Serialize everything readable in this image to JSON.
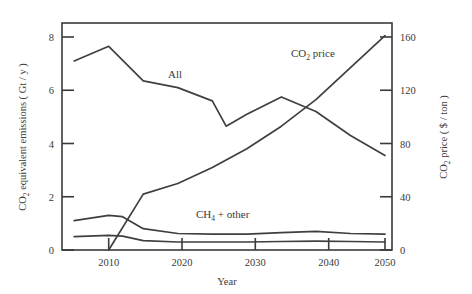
{
  "chart_data": {
    "type": "line",
    "title": "",
    "xlabel": "Year",
    "ylabel": "CO 2 equivalent emissions ( Gt / y )",
    "y2label": "CO 2 price ( $ / ton )",
    "xlim": [
      2005,
      2050
    ],
    "ylim": [
      0,
      8.6
    ],
    "y2lim": [
      0,
      172
    ],
    "grid": false,
    "legend_position": "inline-annotations",
    "xticks": [
      2010,
      2020,
      2030,
      2040,
      2050
    ],
    "xticklabels": [
      "2010",
      "2020",
      "2030",
      "2040",
      "2050"
    ],
    "yticks": [
      0,
      2,
      4,
      6,
      8
    ],
    "yticklabels": [
      "0",
      "2",
      "4",
      "6",
      "8"
    ],
    "y2ticks": [
      0,
      40,
      80,
      120,
      160
    ],
    "y2ticklabels": [
      "0",
      "40",
      "80",
      "120",
      "160"
    ],
    "annotations": [
      {
        "text": "All",
        "x": 2023,
        "y": 6.6
      },
      {
        "text": "CO 2 price",
        "x": 2043,
        "y": 7.5
      },
      {
        "text": "CH 4 + other",
        "x": 2029,
        "y": 1.5
      }
    ],
    "series": [
      {
        "name": "All",
        "axis": "left",
        "unit": "Gt/y",
        "x": [
          2005,
          2010,
          2015,
          2020,
          2025,
          2027,
          2030,
          2035,
          2040,
          2045,
          2050
        ],
        "values": [
          7.1,
          7.65,
          6.35,
          6.1,
          5.6,
          4.65,
          5.1,
          5.75,
          5.2,
          4.3,
          3.55
        ]
      },
      {
        "name": "CO 2 price",
        "axis": "right",
        "unit": "$/ton",
        "x": [
          2010,
          2015,
          2020,
          2025,
          2030,
          2035,
          2040,
          2045,
          2050
        ],
        "values": [
          0,
          42,
          50,
          62,
          76,
          93,
          113,
          137,
          161
        ]
      },
      {
        "name": "CH 4 + other (upper)",
        "axis": "left",
        "unit": "Gt/y",
        "x": [
          2005,
          2010,
          2012,
          2015,
          2020,
          2025,
          2030,
          2035,
          2040,
          2045,
          2050
        ],
        "values": [
          1.1,
          1.3,
          1.25,
          0.8,
          0.62,
          0.6,
          0.6,
          0.65,
          0.7,
          0.62,
          0.6
        ]
      },
      {
        "name": "CH 4 + other (lower)",
        "axis": "left",
        "unit": "Gt/y",
        "x": [
          2005,
          2010,
          2012,
          2015,
          2020,
          2025,
          2030,
          2035,
          2040,
          2045,
          2050
        ],
        "values": [
          0.5,
          0.55,
          0.52,
          0.35,
          0.3,
          0.3,
          0.3,
          0.32,
          0.33,
          0.32,
          0.3
        ]
      }
    ]
  },
  "axes": {
    "left_title_parts": {
      "pre": "CO",
      "sub": "2",
      "post": " equivalent emissions ( Gt / y )"
    },
    "right_title_parts": {
      "pre": "CO",
      "sub": "2",
      "post": " price ( $ / ton )"
    },
    "x_title": "Year"
  },
  "labels": {
    "all": "All",
    "co2_price_pre": "CO",
    "co2_price_sub": "2",
    "co2_price_post": " price",
    "ch4_pre": "CH",
    "ch4_sub": "4",
    "ch4_post": " + other"
  }
}
